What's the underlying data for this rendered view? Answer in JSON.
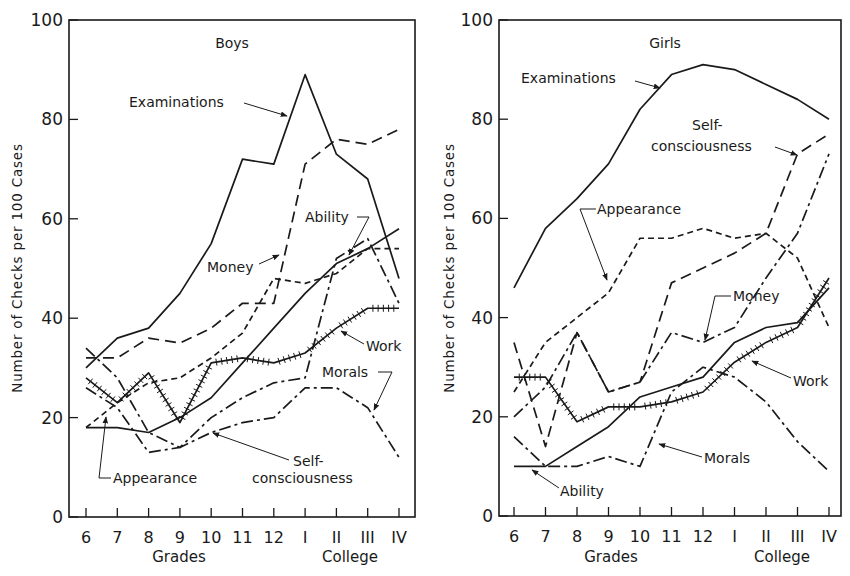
{
  "chart_data": [
    {
      "type": "line",
      "title": "Boys",
      "xlabel_left": "Grades",
      "xlabel_right": "College",
      "ylabel": "Number of Checks per 100 Cases",
      "categories": [
        "6",
        "7",
        "8",
        "9",
        "10",
        "11",
        "12",
        "I",
        "II",
        "III",
        "IV"
      ],
      "yticks": [
        0,
        20,
        40,
        60,
        80,
        100
      ],
      "ylim": [
        0,
        100
      ],
      "grid": false,
      "series": [
        {
          "name": "Examinations",
          "style": "solid",
          "values": [
            30,
            36,
            38,
            45,
            55,
            72,
            71,
            89,
            73,
            68,
            48
          ]
        },
        {
          "name": "Money",
          "style": "longdash",
          "values": [
            32,
            32,
            36,
            35,
            38,
            43,
            43,
            71,
            76,
            75,
            78
          ]
        },
        {
          "name": "Ability",
          "style": "solid",
          "values": [
            18,
            18,
            17,
            20,
            24,
            31,
            38,
            45,
            51,
            54,
            58
          ]
        },
        {
          "name": "Appearance",
          "style": "shortdash",
          "values": [
            18,
            23,
            27,
            28,
            32,
            37,
            48,
            47,
            49,
            54,
            54
          ]
        },
        {
          "name": "Work",
          "style": "hatched",
          "values": [
            28,
            23,
            29,
            19,
            31,
            32,
            31,
            33,
            38,
            42,
            42
          ]
        },
        {
          "name": "Self-consciousness",
          "style": "dashdot",
          "values": [
            26,
            22,
            13,
            14,
            20,
            24,
            27,
            28,
            52,
            56,
            43
          ]
        },
        {
          "name": "Morals",
          "style": "dashdot",
          "values": [
            34,
            28,
            17,
            14,
            17,
            19,
            20,
            26,
            26,
            22,
            12
          ]
        }
      ],
      "annotations": [
        "Examinations",
        "Money",
        "Ability",
        "Work",
        "Morals",
        "Self-consciousness",
        "Appearance"
      ]
    },
    {
      "type": "line",
      "title": "Girls",
      "xlabel_left": "Grades",
      "xlabel_right": "College",
      "ylabel": "Number of Checks per 100 Cases",
      "categories": [
        "6",
        "7",
        "8",
        "9",
        "10",
        "11",
        "12",
        "I",
        "II",
        "III",
        "IV"
      ],
      "yticks": [
        0,
        20,
        40,
        60,
        80,
        100
      ],
      "ylim": [
        0,
        100
      ],
      "grid": false,
      "series": [
        {
          "name": "Examinations",
          "style": "solid",
          "values": [
            46,
            58,
            64,
            71,
            82,
            89,
            91,
            90,
            87,
            84,
            80
          ]
        },
        {
          "name": "Self-consciousness",
          "style": "dashdot",
          "values": [
            20,
            26,
            37,
            25,
            27,
            37,
            35,
            38,
            48,
            57,
            73,
            77
          ]
        },
        {
          "name": "Appearance",
          "style": "shortdash",
          "values": [
            25,
            35,
            40,
            45,
            56,
            56,
            58,
            56,
            57,
            52,
            38
          ]
        },
        {
          "name": "Money",
          "style": "longdash",
          "values": [
            35,
            14,
            37,
            25,
            27,
            47,
            50,
            53,
            57,
            73,
            77
          ]
        },
        {
          "name": "Ability",
          "style": "solid",
          "values": [
            10,
            10,
            14,
            18,
            24,
            26,
            28,
            35,
            38,
            39,
            46
          ]
        },
        {
          "name": "Work",
          "style": "hatched",
          "values": [
            28,
            28,
            19,
            22,
            22,
            23,
            25,
            31,
            35,
            38,
            48
          ]
        },
        {
          "name": "Morals",
          "style": "dashdot",
          "values": [
            16,
            10,
            10,
            12,
            10,
            25,
            30,
            28,
            23,
            15,
            9
          ]
        }
      ],
      "annotations": [
        "Examinations",
        "Self-consciousness",
        "Appearance",
        "Money",
        "Work",
        "Morals",
        "Ability"
      ]
    }
  ],
  "panels": {
    "boys": {
      "title": "Boys",
      "ylabel": "Number of Checks per 100 Cases",
      "xlabel_left": "Grades",
      "xlabel_right": "College",
      "labels": {
        "examinations": "Examinations",
        "money": "Money",
        "ability": "Ability",
        "work": "Work",
        "morals": "Morals",
        "self1": "Self-",
        "self2": "consciousness",
        "appearance": "Appearance"
      }
    },
    "girls": {
      "title": "Girls",
      "ylabel": "Number of Checks per 100 Cases",
      "xlabel_left": "Grades",
      "xlabel_right": "College",
      "labels": {
        "examinations": "Examinations",
        "self1": "Self-",
        "self2": "consciousness",
        "appearance": "Appearance",
        "money": "Money",
        "work": "Work",
        "morals": "Morals",
        "ability": "Ability"
      }
    }
  }
}
